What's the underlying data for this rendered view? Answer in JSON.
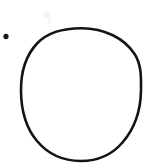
{
  "figure": {
    "title": "Hand-drawn circle with adjacent dot",
    "background_color": "#ffffff",
    "width": 165,
    "height": 168,
    "ink_color": "#141414",
    "smudge_color": "#f2f2f2",
    "elements": [
      {
        "name": "circle-outline",
        "shape": "circle",
        "label": "Large hand-drawn circle outline",
        "center_x": 81,
        "center_y": 94.5,
        "radius_x": 60,
        "radius_y": 66.5,
        "stroke_width": 2.6,
        "fill": "none",
        "stroke": "#141414",
        "bounds": {
          "left": 21,
          "top": 28,
          "right": 141,
          "bottom": 161
        }
      },
      {
        "name": "dot-marker",
        "shape": "dot",
        "label": "Small filled dot",
        "center_x": 6,
        "center_y": 36.5,
        "radius_x": 2.6,
        "radius_y": 2.8,
        "fill": "#141414",
        "stroke": "none",
        "bounds": {
          "left": 3,
          "top": 34,
          "right": 9,
          "bottom": 39
        }
      },
      {
        "name": "faint-smudge",
        "shape": "smudge",
        "label": "Faint scan artifact",
        "center_x": 47,
        "center_y": 16,
        "radius_x": 4,
        "radius_y": 5,
        "fill": "#f4f4f4",
        "stroke": "none"
      }
    ]
  }
}
